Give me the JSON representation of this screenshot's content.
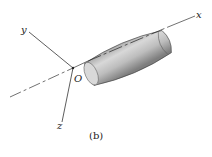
{
  "figure": {
    "caption": "(b)",
    "axes": {
      "x": "x",
      "y": "y",
      "z": "z"
    },
    "origin_label": "O",
    "object": "cylindrical body with rounded ends aligned along x-axis",
    "colors": {
      "body_light": "#e2e2e2",
      "body_dark": "#7a7a7a",
      "line": "#333333"
    }
  }
}
